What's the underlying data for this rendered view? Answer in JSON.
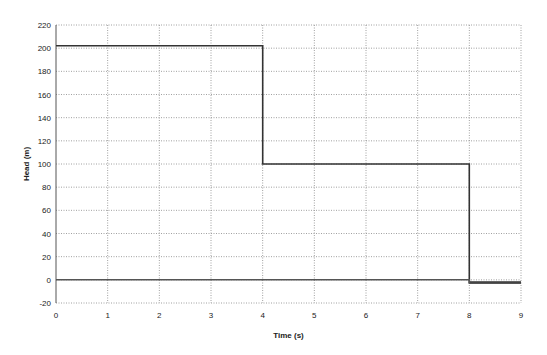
{
  "chart_data": {
    "type": "line",
    "title": "",
    "xlabel": "Time (s)",
    "ylabel": "Head (m)",
    "xlim": [
      0,
      9
    ],
    "ylim": [
      -20,
      220
    ],
    "xticks": [
      0,
      1,
      2,
      3,
      4,
      5,
      6,
      7,
      8,
      9
    ],
    "yticks": [
      -20,
      0,
      20,
      40,
      60,
      80,
      100,
      120,
      140,
      160,
      180,
      200,
      220
    ],
    "grid": true,
    "legend": "none",
    "series": [
      {
        "name": "head",
        "color": "#333333",
        "points": [
          [
            0,
            202
          ],
          [
            4,
            202
          ],
          [
            4,
            100
          ],
          [
            8,
            100
          ],
          [
            8,
            -2
          ],
          [
            9,
            -2
          ]
        ]
      },
      {
        "name": "baseline",
        "color": "#555555",
        "points": [
          [
            0,
            0
          ],
          [
            8,
            0
          ],
          [
            8,
            -3
          ],
          [
            9,
            -3
          ]
        ]
      }
    ]
  }
}
